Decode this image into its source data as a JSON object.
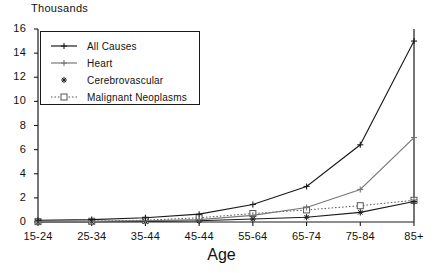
{
  "chart_data": {
    "type": "line",
    "title": "",
    "unit_label": "Thousands",
    "xlabel": "Age",
    "ylabel": "",
    "categories": [
      "15-24",
      "25-34",
      "35-44",
      "45-44",
      "55-64",
      "65-74",
      "75-84",
      "85+"
    ],
    "ylim": [
      0,
      16
    ],
    "yticks": [
      0,
      2,
      4,
      6,
      8,
      10,
      12,
      14,
      16
    ],
    "grid": false,
    "legend_position": "upper-left-inside",
    "series": [
      {
        "name": "All Causes",
        "marker": "plus",
        "dash": "solid",
        "color": "#1a1a1a",
        "values": [
          0.15,
          0.2,
          0.35,
          0.65,
          1.45,
          2.95,
          6.4,
          15.0
        ]
      },
      {
        "name": "Heart",
        "marker": "plus",
        "dash": "solid",
        "color": "#777777",
        "values": [
          0.05,
          0.05,
          0.1,
          0.2,
          0.55,
          1.2,
          2.7,
          7.0
        ]
      },
      {
        "name": "Cerebrovascular",
        "marker": "star",
        "dash": "solid",
        "color": "#1a1a1a",
        "values": [
          0.02,
          0.03,
          0.05,
          0.1,
          0.25,
          0.4,
          0.8,
          1.7
        ]
      },
      {
        "name": "Malignant Neoplasms",
        "marker": "square",
        "dash": "dotted",
        "color": "#555555",
        "values": [
          0.03,
          0.06,
          0.15,
          0.35,
          0.7,
          1.0,
          1.35,
          1.8
        ]
      }
    ]
  }
}
